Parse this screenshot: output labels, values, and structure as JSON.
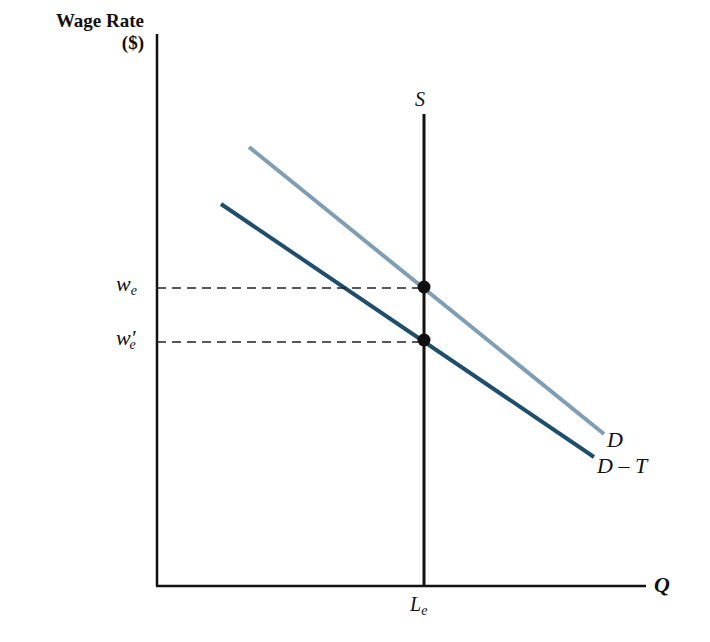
{
  "diagram": {
    "y_axis_label_line1": "Wage Rate",
    "y_axis_label_line2": "($)",
    "x_axis_label": "Q",
    "supply_label": "S",
    "demand_label": "D",
    "demand_tax_label": "D – T",
    "wage_label": "w",
    "wage_sub": "e",
    "wage_prime_label": "w′",
    "wage_prime_sub": "e",
    "quantity_label": "L",
    "quantity_sub": "e",
    "colors": {
      "axes": "#111111",
      "supply": "#111111",
      "demand": "#7f9db5",
      "demand_tax": "#1e4e6e",
      "dashed": "#222222"
    }
  }
}
